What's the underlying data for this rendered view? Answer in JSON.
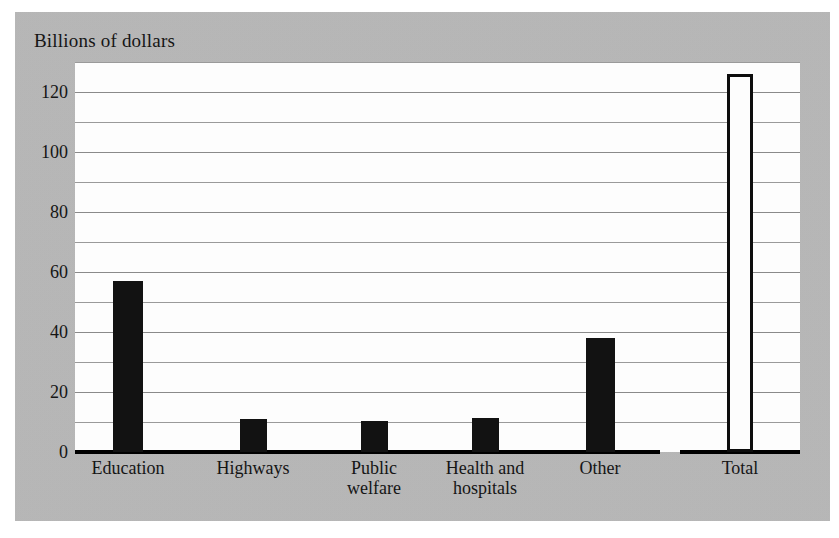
{
  "chart_data": {
    "type": "bar",
    "title": "Billions of dollars",
    "subtitle": "",
    "xlabel": "",
    "ylabel": "Billions of dollars",
    "categories": [
      "Education",
      "Highways",
      "Public\nwelfare",
      "Health and\nhospitals",
      "Other",
      "Total"
    ],
    "values": [
      57,
      11,
      10.5,
      11.5,
      38,
      126
    ],
    "series": [
      {
        "name": "State and local government expenditure",
        "values": [
          57,
          11,
          10.5,
          11.5,
          38,
          126
        ]
      }
    ],
    "ylim": [
      0,
      130
    ],
    "yticks": [
      0,
      20,
      40,
      60,
      80,
      100,
      120
    ],
    "ytick_labels": [
      "0",
      "20",
      "40",
      "60",
      "80",
      "100",
      "120"
    ],
    "minor_tick_step": 10,
    "grid": true,
    "grid_axis": "y",
    "legend": false,
    "legend_position": "none",
    "bar_styles": [
      "filled",
      "filled",
      "filled",
      "filled",
      "filled",
      "hollow"
    ],
    "colors": {
      "bar_fill": "#121212",
      "bar_hollow_fill": "#fdfdfd",
      "bar_outline": "#0d0d0d",
      "plot_background": "#fdfdfd",
      "panel_background": "#b9b9b9",
      "page_background": "#ffffff",
      "gridline": "#9a9a9a",
      "axis": "#000000",
      "text": "#151515"
    }
  },
  "figure": {
    "title_text": "Billions of dollars"
  }
}
